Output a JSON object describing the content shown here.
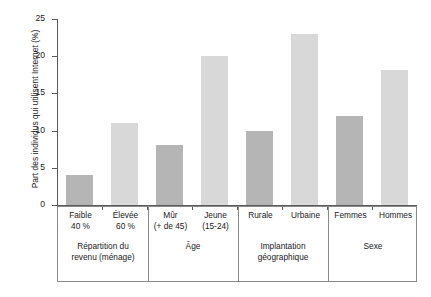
{
  "chart_data": {
    "type": "bar",
    "title": "",
    "xlabel": "",
    "ylabel": "Part des individus qui utilisent Internet (%)",
    "ylim": [
      0,
      25
    ],
    "yticks": [
      "0",
      "5",
      "10",
      "15",
      "20",
      "25"
    ],
    "grid": false,
    "legend": null,
    "categories": [
      "Faible 40 %",
      "Élevée 60 %",
      "Mûr (+ de 45)",
      "Jeune (15-24)",
      "Rurale",
      "Urbaine",
      "Femmes",
      "Hommes"
    ],
    "values": [
      4,
      11,
      8,
      20,
      10,
      23,
      12,
      18.2
    ],
    "bars": [
      {
        "label_line1": "Faible",
        "label_line2": "40 %",
        "value": 4,
        "shade": "dark"
      },
      {
        "label_line1": "Élevée",
        "label_line2": "60 %",
        "value": 11,
        "shade": "light"
      },
      {
        "label_line1": "Mûr",
        "label_line2": "(+ de 45)",
        "value": 8,
        "shade": "dark"
      },
      {
        "label_line1": "Jeune",
        "label_line2": "(15-24)",
        "value": 20,
        "shade": "light"
      },
      {
        "label_line1": "Rurale",
        "label_line2": "",
        "value": 10,
        "shade": "dark"
      },
      {
        "label_line1": "Urbaine",
        "label_line2": "",
        "value": 23,
        "shade": "light"
      },
      {
        "label_line1": "Femmes",
        "label_line2": "",
        "value": 12,
        "shade": "dark"
      },
      {
        "label_line1": "Hommes",
        "label_line2": "",
        "value": 18.2,
        "shade": "light"
      }
    ],
    "groups": [
      {
        "line1": "Répartition du",
        "line2": "revenu (ménage)"
      },
      {
        "line1": "Âge",
        "line2": ""
      },
      {
        "line1": "Implantation",
        "line2": "géographique"
      },
      {
        "line1": "Sexe",
        "line2": ""
      }
    ],
    "colors": {
      "bar_dark": "#b5b5b5",
      "bar_light": "#d8d8d8",
      "axis": "#5a5a5a",
      "box_border": "#8a8a8a",
      "text": "#1a1a1a",
      "background": "#ffffff"
    }
  }
}
